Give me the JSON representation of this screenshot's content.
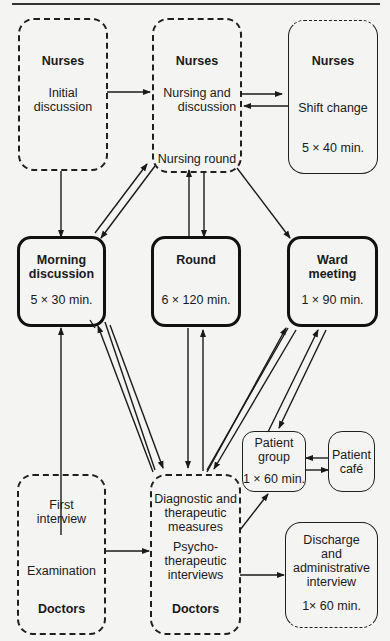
{
  "figure": {
    "nurses_initial": {
      "role": "Nurses",
      "activity": "Initial discussion"
    },
    "nurses_nursing": {
      "role": "Nurses",
      "activity_line1": "Nursing and",
      "activity_line2": "discussion",
      "round": "Nursing round"
    },
    "nurses_shift": {
      "role": "Nurses",
      "activity": "Shift change",
      "duration": "5 × 40 min."
    },
    "morning_discussion": {
      "title_line1": "Morning",
      "title_line2": "discussion",
      "duration": "5 × 30 min."
    },
    "round": {
      "title": "Round",
      "duration": "6 × 120 min."
    },
    "ward_meeting": {
      "title_line1": "Ward",
      "title_line2": "meeting",
      "duration": "1 × 90 min."
    },
    "patient_group": {
      "line1": "Patient",
      "line2": "group",
      "duration": "1 × 60 min."
    },
    "patient_cafe": {
      "line1": "Patient",
      "line2": "café"
    },
    "doctors_first": {
      "line1": "First",
      "line2": "interview",
      "exam": "Examination",
      "role": "Doctors"
    },
    "doctors_diag": {
      "line1": "Diagnostic and",
      "line2": "therapeutic",
      "line3": "measures",
      "psy1": "Psycho-",
      "psy2": "therapeutic",
      "psy3": "interviews",
      "role": "Doctors"
    },
    "discharge": {
      "line1": "Discharge",
      "line2": "and",
      "line3": "administrative",
      "line4": "interview",
      "duration": "1× 60 min."
    }
  },
  "colors": {
    "ink": "#1f1f1f",
    "paper": "#f4f4f2"
  }
}
